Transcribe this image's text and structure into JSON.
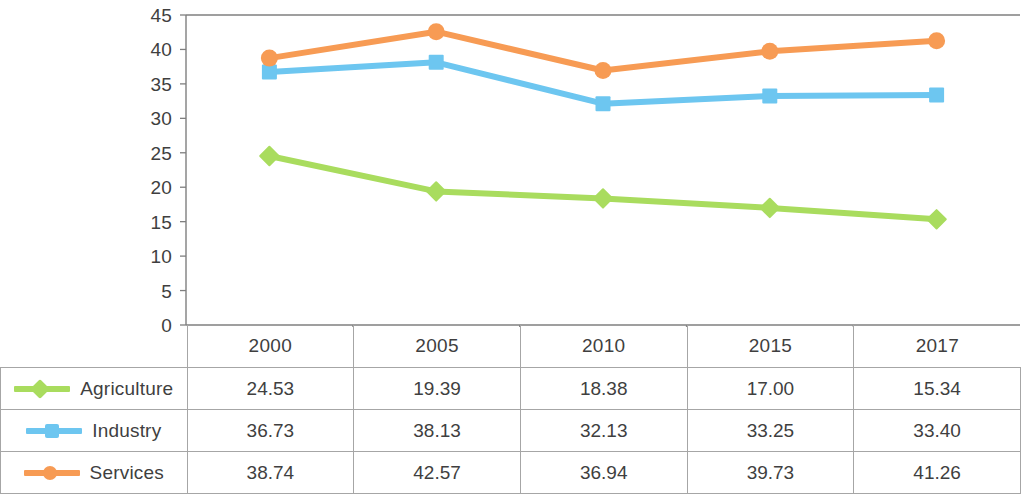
{
  "chart_data": {
    "type": "line",
    "title": "",
    "xlabel": "",
    "ylabel": "",
    "ylim": [
      0,
      45
    ],
    "y_ticks": [
      45,
      40,
      35,
      30,
      25,
      20,
      15,
      10,
      5,
      0
    ],
    "grid": false,
    "legend_position": "table-left",
    "categories": [
      "2000",
      "2005",
      "2010",
      "2015",
      "2017"
    ],
    "series": [
      {
        "name": "Agriculture",
        "color": "#A9DC5E",
        "marker": "diamond",
        "values": [
          24.53,
          19.39,
          18.38,
          17.0,
          15.34
        ],
        "labels": [
          "24.53",
          "19.39",
          "18.38",
          "17.00",
          "15.34"
        ]
      },
      {
        "name": "Industry",
        "color": "#6DC6F0",
        "marker": "square",
        "values": [
          36.73,
          38.13,
          32.13,
          33.25,
          33.4
        ],
        "labels": [
          "36.73",
          "38.13",
          "32.13",
          "33.25",
          "33.40"
        ]
      },
      {
        "name": "Services",
        "color": "#F79B54",
        "marker": "circle",
        "values": [
          38.74,
          42.57,
          36.94,
          39.73,
          41.26
        ],
        "labels": [
          "38.74",
          "42.57",
          "36.94",
          "39.73",
          "41.26"
        ]
      }
    ]
  },
  "table": {
    "corner_label": "",
    "column_headers": [
      "2000",
      "2005",
      "2010",
      "2015",
      "2017"
    ],
    "rows": [
      {
        "label": "Agriculture",
        "marker": "diamond",
        "color": "#A9DC5E",
        "cells": [
          "24.53",
          "19.39",
          "18.38",
          "17.00",
          "15.34"
        ]
      },
      {
        "label": "Industry",
        "marker": "square",
        "color": "#6DC6F0",
        "cells": [
          "36.73",
          "38.13",
          "32.13",
          "33.25",
          "33.40"
        ]
      },
      {
        "label": "Services",
        "marker": "circle",
        "color": "#F79B54",
        "cells": [
          "38.74",
          "42.57",
          "36.94",
          "39.73",
          "41.26"
        ]
      }
    ]
  },
  "axis": {
    "tick_labels": [
      "45",
      "40",
      "35",
      "30",
      "25",
      "20",
      "15",
      "10",
      "5",
      "0"
    ]
  },
  "colors": {
    "agriculture": "#A9DC5E",
    "industry": "#6DC6F0",
    "services": "#F79B54",
    "axis": "#7f7f7f",
    "table_border": "#a6a6a6",
    "text": "#3f3f3f"
  }
}
